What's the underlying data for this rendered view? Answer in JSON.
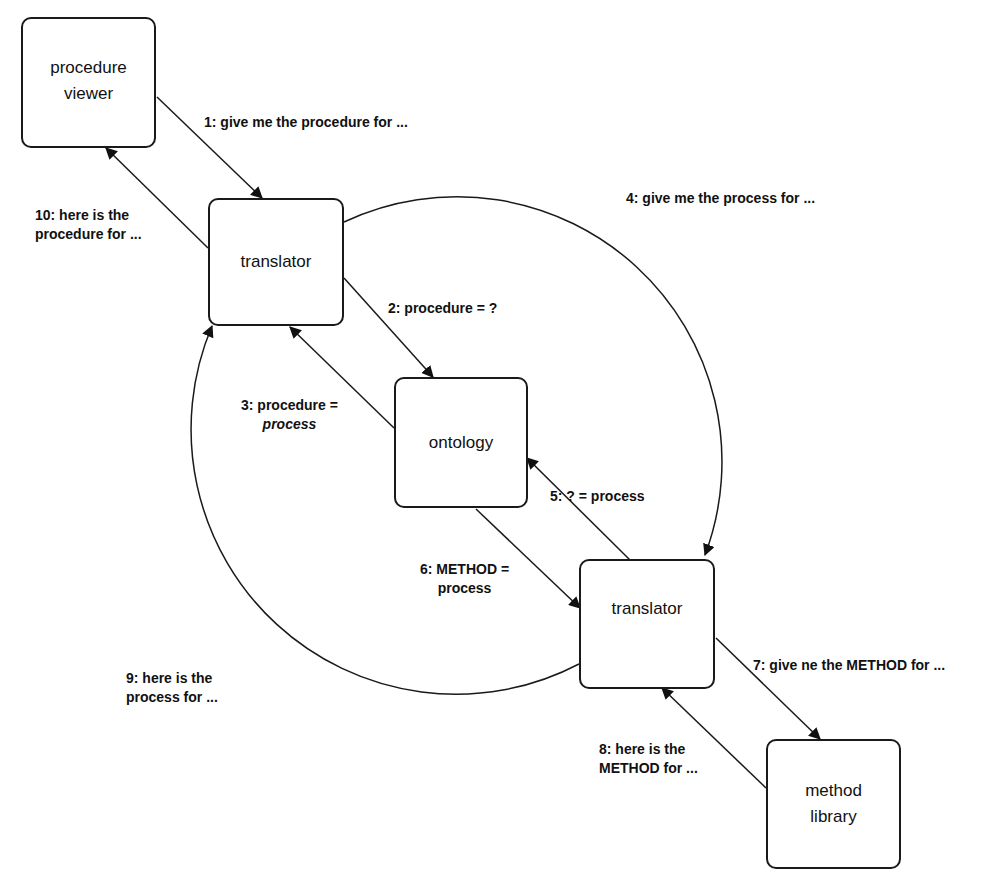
{
  "nodes": {
    "procedure_viewer": {
      "line1": "procedure",
      "line2": "viewer"
    },
    "translator_top": {
      "label": "translator"
    },
    "ontology": {
      "label": "ontology"
    },
    "translator_bottom": {
      "label": "translator"
    },
    "method_library": {
      "line1": "method",
      "line2": "library"
    }
  },
  "messages": [
    {
      "step": 1,
      "line1": "1: give me the procedure for ..."
    },
    {
      "step": 2,
      "line1": "2: procedure = ?"
    },
    {
      "step": 3,
      "line1": "3: procedure =",
      "line2": "process"
    },
    {
      "step": 4,
      "line1": "4: give me the process for ..."
    },
    {
      "step": 5,
      "line1": "5: ? = process"
    },
    {
      "step": 6,
      "line1": "6: METHOD =",
      "line2": "process"
    },
    {
      "step": 7,
      "line1": "7: give ne the METHOD for ..."
    },
    {
      "step": 8,
      "line1": "8: here is the",
      "line2": "METHOD for ..."
    },
    {
      "step": 9,
      "line1": "9: here is the",
      "line2": "process for ..."
    },
    {
      "step": 10,
      "line1": "10: here is the",
      "line2": "procedure for ..."
    }
  ]
}
